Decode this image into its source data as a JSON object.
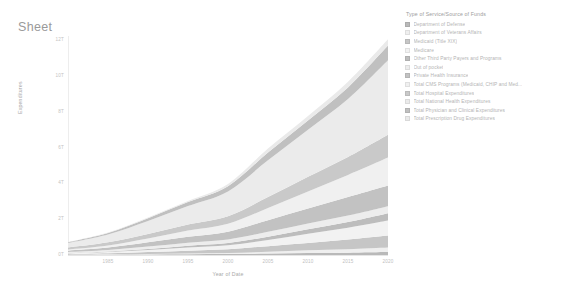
{
  "sheet": {
    "title": "Sheet"
  },
  "legend": {
    "title": "Type of Service/Source of Funds",
    "items": [
      {
        "label": "Department of Defense",
        "color": "#b9b9b9"
      },
      {
        "label": "Department of Veterans Affairs",
        "color": "#efefef"
      },
      {
        "label": "Medicaid (Title XIX)",
        "color": "#c6c6c6"
      },
      {
        "label": "Medicare",
        "color": "#f2f2f2"
      },
      {
        "label": "Other Third Party Payers and Programs",
        "color": "#bdbdbd"
      },
      {
        "label": "Out of pocket",
        "color": "#ededed"
      },
      {
        "label": "Private Health Insurance",
        "color": "#c2c2c2"
      },
      {
        "label": "Total CMS Programs (Medicaid, CHIP and Med...",
        "color": "#f0f0f0"
      },
      {
        "label": "Total Hospital Expenditures",
        "color": "#c9c9c9"
      },
      {
        "label": "Total National Health Expenditures",
        "color": "#ebebeb"
      },
      {
        "label": "Total Physician and Clinical Expenditures",
        "color": "#c0c0c0"
      },
      {
        "label": "Total Prescription Drug Expenditures",
        "color": "#eaeaea"
      }
    ]
  },
  "chart_data": {
    "type": "area",
    "title": "Sheet",
    "subtitle": "",
    "xlabel": "Year of Date",
    "ylabel": "Expenditures",
    "stacked": true,
    "grid": false,
    "legend_position": "right",
    "legend_title": "Type of Service/Source of Funds",
    "x": [
      1980,
      1985,
      1990,
      1995,
      2000,
      2005,
      2010,
      2015,
      2020
    ],
    "xticks": [
      "1985",
      "1990",
      "1995",
      "2000",
      "2005",
      "2010",
      "2015",
      "2020"
    ],
    "xlim": [
      1980,
      2020
    ],
    "yticks": [
      "12T",
      "10T",
      "8T",
      "6T",
      "4T",
      "2T",
      "0T"
    ],
    "ylim": [
      0,
      13000000000000
    ],
    "series": [
      {
        "name": "Department of Defense",
        "color": "#b9b9b9",
        "values": [
          0.01,
          0.02,
          0.03,
          0.04,
          0.05,
          0.08,
          0.11,
          0.13,
          0.16
        ]
      },
      {
        "name": "Department of Veterans Affairs",
        "color": "#efefef",
        "values": [
          0.01,
          0.02,
          0.03,
          0.04,
          0.06,
          0.1,
          0.15,
          0.19,
          0.25
        ]
      },
      {
        "name": "Medicaid (Title XIX)",
        "color": "#c6c6c6",
        "values": [
          0.03,
          0.05,
          0.1,
          0.16,
          0.21,
          0.31,
          0.4,
          0.54,
          0.67
        ]
      },
      {
        "name": "Medicare",
        "color": "#f2f2f2",
        "values": [
          0.04,
          0.07,
          0.11,
          0.18,
          0.22,
          0.34,
          0.52,
          0.65,
          0.83
        ]
      },
      {
        "name": "Other Third Party Payers and Programs",
        "color": "#bdbdbd",
        "values": [
          0.02,
          0.03,
          0.06,
          0.09,
          0.12,
          0.18,
          0.24,
          0.31,
          0.4
        ]
      },
      {
        "name": "Out of pocket",
        "color": "#ededed",
        "values": [
          0.06,
          0.09,
          0.14,
          0.17,
          0.2,
          0.27,
          0.32,
          0.36,
          0.39
        ]
      },
      {
        "name": "Private Health Insurance",
        "color": "#c2c2c2",
        "values": [
          0.07,
          0.13,
          0.23,
          0.33,
          0.43,
          0.65,
          0.84,
          1.03,
          1.15
        ]
      },
      {
        "name": "Total CMS Programs (Medicaid, CHIP and Med...",
        "color": "#f0f0f0",
        "values": [
          0.07,
          0.12,
          0.21,
          0.34,
          0.44,
          0.67,
          0.94,
          1.22,
          1.54
        ]
      },
      {
        "name": "Total Hospital Expenditures",
        "color": "#c9c9c9",
        "values": [
          0.1,
          0.17,
          0.25,
          0.34,
          0.42,
          0.61,
          0.81,
          1.0,
          1.27
        ]
      },
      {
        "name": "Total National Health Expenditures",
        "color": "#ebebeb",
        "values": [
          0.25,
          0.43,
          0.72,
          1.02,
          1.37,
          2.03,
          2.6,
          3.2,
          4.12
        ]
      },
      {
        "name": "Total Physician and Clinical Expenditures",
        "color": "#c0c0c0",
        "values": [
          0.05,
          0.09,
          0.16,
          0.22,
          0.29,
          0.43,
          0.52,
          0.64,
          0.81
        ]
      },
      {
        "name": "Total Prescription Drug Expenditures",
        "color": "#eaeaea",
        "values": [
          0.01,
          0.03,
          0.04,
          0.06,
          0.12,
          0.22,
          0.25,
          0.32,
          0.35
        ]
      }
    ]
  }
}
